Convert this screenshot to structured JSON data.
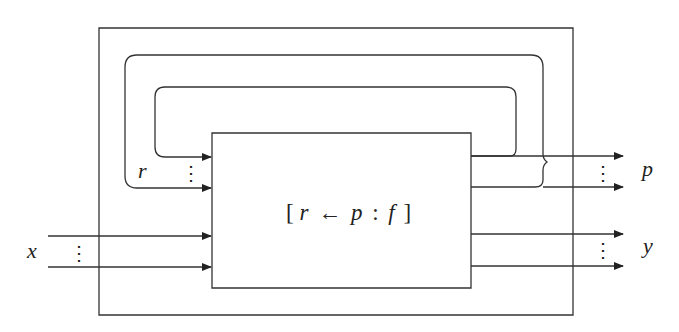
{
  "diagram": {
    "type": "block-diagram",
    "inner_box": {
      "label_open": "[",
      "label_r": "r",
      "label_arrow": "←",
      "label_p": "p",
      "label_colon": ":",
      "label_f": "f",
      "label_close": "]"
    },
    "inputs": {
      "feedback_label": "r",
      "external_label": "x",
      "ellipsis": "⋮"
    },
    "outputs": {
      "feedback_label": "p",
      "external_label": "y",
      "ellipsis": "⋮"
    },
    "colors": {
      "line": "#333333",
      "background": "#ffffff"
    }
  }
}
